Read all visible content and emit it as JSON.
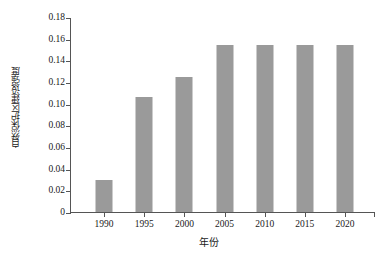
{
  "chart_data": {
    "type": "bar",
    "title": "",
    "xlabel": "年份",
    "ylabel": "自然保护区建设强度",
    "categories": [
      "1990",
      "1995",
      "2000",
      "2005",
      "2010",
      "2015",
      "2020"
    ],
    "values": [
      0.03,
      0.106,
      0.125,
      0.154,
      0.154,
      0.154,
      0.154
    ],
    "ylim": [
      0,
      0.18
    ],
    "yticks": [
      "0",
      "0.02",
      "0.04",
      "0.06",
      "0.08",
      "0.10",
      "0.12",
      "0.14",
      "0.16",
      "0.18"
    ],
    "ytick_values": [
      0,
      0.02,
      0.04,
      0.06,
      0.08,
      0.1,
      0.12,
      0.14,
      0.16,
      0.18
    ],
    "grid": false,
    "legend": null,
    "series_color": "#9a9a9a",
    "axis_color": "#555555",
    "background": "#ffffff"
  }
}
